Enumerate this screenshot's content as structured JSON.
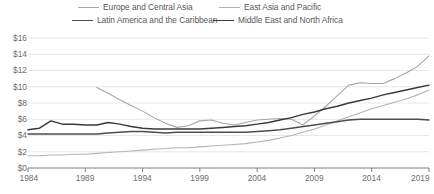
{
  "legend": {
    "position": "top",
    "columns": 2,
    "entries": [
      {
        "label": "Europe and Central Asia",
        "color": "#a6a6a6",
        "width": 1.1
      },
      {
        "label": "East Asia and Pacific",
        "color": "#b4b4b4",
        "width": 1.1
      },
      {
        "label": "Latin America and the Caribbean",
        "color": "#4d4d4d",
        "width": 1.5
      },
      {
        "label": "Middle East and North Africa",
        "color": "#3a3a3a",
        "width": 1.5
      }
    ]
  },
  "axes": {
    "y_ticks": [
      "$0",
      "$2",
      "$4",
      "$6",
      "$8",
      "$10",
      "$12",
      "$14",
      "$16"
    ],
    "x_ticks": [
      "1984",
      "1989",
      "1994",
      "1999",
      "2004",
      "2009",
      "2014",
      "2019"
    ],
    "grid": true,
    "axis_color": "#7f7f7f",
    "grid_color": "#e4e8ec"
  },
  "chart_data": {
    "type": "line",
    "title": "",
    "xlabel": "",
    "ylabel": "",
    "xlim": [
      1984,
      2019
    ],
    "ylim": [
      0,
      16
    ],
    "ytick_step": 2,
    "xtick_step": 5,
    "grid": true,
    "legend_position": "top",
    "x": [
      1984,
      1985,
      1986,
      1987,
      1988,
      1989,
      1990,
      1991,
      1992,
      1993,
      1994,
      1995,
      1996,
      1997,
      1998,
      1999,
      2000,
      2001,
      2002,
      2003,
      2004,
      2005,
      2006,
      2007,
      2008,
      2009,
      2010,
      2011,
      2012,
      2013,
      2014,
      2015,
      2016,
      2017,
      2018,
      2019
    ],
    "series": [
      {
        "name": "Europe and Central Asia",
        "color": "#a6a6a6",
        "values": [
          null,
          null,
          null,
          null,
          null,
          null,
          9.9,
          9.2,
          8.4,
          7.7,
          7.0,
          6.2,
          5.5,
          5.0,
          5.2,
          5.8,
          5.9,
          5.5,
          5.3,
          5.6,
          5.9,
          6.0,
          6.1,
          6.0,
          5.3,
          6.4,
          7.6,
          8.9,
          10.2,
          10.5,
          10.4,
          10.4,
          11.0,
          11.7,
          12.5,
          13.8
        ]
      },
      {
        "name": "East Asia and Pacific",
        "color": "#b4b4b4",
        "values": [
          1.5,
          1.5,
          1.6,
          1.6,
          1.7,
          1.7,
          1.8,
          1.9,
          2.0,
          2.1,
          2.2,
          2.3,
          2.4,
          2.5,
          2.5,
          2.6,
          2.7,
          2.8,
          2.9,
          3.0,
          3.2,
          3.4,
          3.7,
          4.0,
          4.4,
          4.8,
          5.3,
          5.8,
          6.3,
          6.8,
          7.3,
          7.7,
          8.1,
          8.5,
          9.0,
          9.6
        ]
      },
      {
        "name": "Latin America and the Caribbean",
        "color": "#4d4d4d",
        "values": [
          4.2,
          4.2,
          4.2,
          4.2,
          4.2,
          4.2,
          4.2,
          4.3,
          4.4,
          4.5,
          4.5,
          4.4,
          4.3,
          4.4,
          4.4,
          4.4,
          4.4,
          4.4,
          4.4,
          4.4,
          4.5,
          4.6,
          4.7,
          4.9,
          5.1,
          5.3,
          5.5,
          5.7,
          5.9,
          6.0,
          6.0,
          6.0,
          6.0,
          6.0,
          6.0,
          5.9
        ]
      },
      {
        "name": "Middle East and North Africa",
        "color": "#3a3a3a",
        "values": [
          4.7,
          4.9,
          5.8,
          5.4,
          5.4,
          5.3,
          5.3,
          5.6,
          5.4,
          5.1,
          4.9,
          4.8,
          4.8,
          4.8,
          4.8,
          4.8,
          4.9,
          5.0,
          5.1,
          5.2,
          5.4,
          5.6,
          5.9,
          6.2,
          6.6,
          6.9,
          7.3,
          7.6,
          8.0,
          8.3,
          8.6,
          9.0,
          9.3,
          9.6,
          9.9,
          10.2
        ]
      }
    ]
  }
}
